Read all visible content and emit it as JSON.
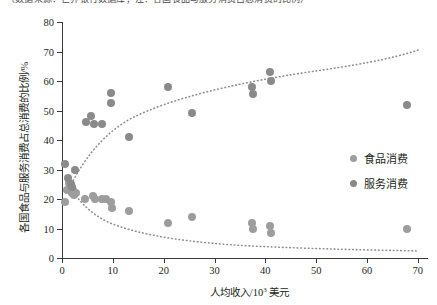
{
  "top_caption": "（数据来源：世界银行数据库；注：各国食品与服务消费占总消费的比例）",
  "axes": {
    "ylabel": "各国食品与服务消费占总消费的比例/%",
    "xlabel_prefix": "人均收入/10",
    "xlabel_sup": "3",
    "xlabel_suffix": "美元",
    "yticks": [
      "0",
      "10",
      "20",
      "30",
      "40",
      "50",
      "60",
      "70",
      "80"
    ],
    "xticks": [
      "0",
      "10",
      "20",
      "30",
      "40",
      "50",
      "60",
      "70"
    ]
  },
  "legend": {
    "position": "inside-right",
    "items": [
      {
        "label": "食品消费",
        "color": "#9d9d9d"
      },
      {
        "label": "服务消费",
        "color": "#8a8a8a"
      }
    ]
  },
  "chart_data": {
    "type": "scatter",
    "title": "",
    "xlabel": "人均收入/10^3 美元",
    "ylabel": "各国食品与服务消费占总消费的比例/%",
    "xlim": [
      0,
      72
    ],
    "ylim": [
      0,
      80
    ],
    "xticks": [
      0,
      10,
      20,
      30,
      40,
      50,
      60,
      70
    ],
    "yticks": [
      0,
      10,
      20,
      30,
      40,
      50,
      60,
      70,
      80
    ],
    "grid": false,
    "series": [
      {
        "name": "食品消费",
        "color": "#9d9d9d",
        "marker": "circle",
        "points": [
          [
            0.5,
            19.0
          ],
          [
            0.9,
            23.0
          ],
          [
            1.3,
            25.5
          ],
          [
            1.6,
            23.5
          ],
          [
            1.9,
            22.0
          ],
          [
            2.2,
            23.0
          ],
          [
            2.4,
            21.5
          ],
          [
            2.8,
            22.0
          ],
          [
            4.6,
            20.0
          ],
          [
            6.0,
            21.0
          ],
          [
            6.4,
            20.0
          ],
          [
            7.9,
            20.0
          ],
          [
            8.6,
            20.0
          ],
          [
            9.6,
            19.0
          ],
          [
            9.8,
            17.0
          ],
          [
            13.2,
            16.0
          ],
          [
            20.8,
            12.0
          ],
          [
            25.6,
            14.0
          ],
          [
            37.3,
            12.0
          ],
          [
            37.5,
            10.0
          ],
          [
            41.0,
            11.0
          ],
          [
            41.2,
            8.5
          ],
          [
            67.8,
            10.0
          ]
        ]
      },
      {
        "name": "服务消费",
        "color": "#8a8a8a",
        "marker": "circle",
        "points": [
          [
            0.6,
            32.0
          ],
          [
            1.2,
            27.0
          ],
          [
            1.7,
            25.0
          ],
          [
            2.0,
            24.0
          ],
          [
            2.5,
            30.0
          ],
          [
            4.7,
            46.0
          ],
          [
            5.8,
            48.0
          ],
          [
            6.3,
            45.5
          ],
          [
            7.9,
            45.5
          ],
          [
            9.6,
            56.0
          ],
          [
            9.7,
            52.5
          ],
          [
            13.1,
            41.0
          ],
          [
            20.9,
            58.0
          ],
          [
            25.5,
            49.0
          ],
          [
            37.4,
            58.0
          ],
          [
            37.5,
            55.5
          ],
          [
            41.0,
            63.0
          ],
          [
            41.2,
            60.0
          ],
          [
            67.9,
            52.0
          ]
        ]
      }
    ],
    "trendlines": [
      {
        "name": "服务消费趋势线",
        "style": "dotted",
        "color": "#8e8e8e",
        "description": "上升的对数型趋势曲线，从约(1,25)升至约(70,71)"
      },
      {
        "name": "食品消费趋势线",
        "style": "dotted",
        "color": "#8e8e8e",
        "description": "下降的对数型趋势曲线，从约(1,25)降至约(70,9)"
      }
    ]
  }
}
